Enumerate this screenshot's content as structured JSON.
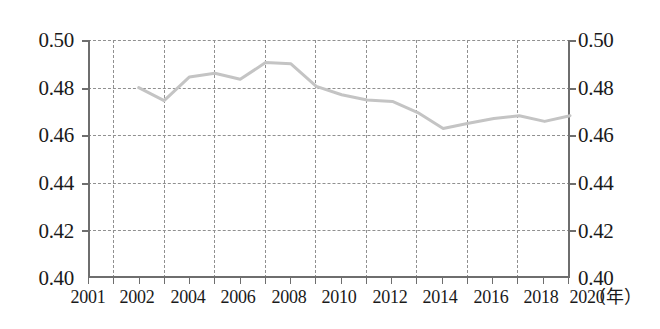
{
  "chart_data": {
    "type": "line",
    "title": "",
    "xlabel": "年",
    "ylabel": "",
    "xlim": [
      2001,
      2020
    ],
    "ylim": [
      0.4,
      0.5
    ],
    "grid": true,
    "legend": null,
    "x_tick_labels": [
      "2001",
      "2002",
      "2004",
      "2006",
      "2008",
      "2010",
      "2012",
      "2014",
      "2016",
      "2018",
      "2020"
    ],
    "x_tick_values": [
      2001,
      2002,
      2004,
      2006,
      2008,
      2010,
      2012,
      2014,
      2016,
      2018,
      2020
    ],
    "y_tick_labels_left": [
      "0.50",
      "0.48",
      "0.46",
      "0.44",
      "0.42",
      "0.40"
    ],
    "y_tick_labels_right": [
      "0.50",
      "0.48",
      "0.46",
      "0.44",
      "0.42",
      "0.40"
    ],
    "y_tick_values": [
      0.5,
      0.48,
      0.46,
      0.44,
      0.42,
      0.4
    ],
    "series": [
      {
        "name": "series-1",
        "color": "#c4c4c4",
        "x": [
          2003,
          2004,
          2005,
          2006,
          2007,
          2008,
          2009,
          2010,
          2011,
          2012,
          2013,
          2014,
          2015,
          2016,
          2017,
          2018,
          2019,
          2020
        ],
        "values": [
          0.48,
          0.4745,
          0.4845,
          0.486,
          0.4835,
          0.4905,
          0.49,
          0.4805,
          0.477,
          0.4748,
          0.4742,
          0.4695,
          0.4628,
          0.465,
          0.467,
          0.4682,
          0.4658,
          0.4682
        ]
      }
    ]
  },
  "axis": {
    "unit_label": "（年）"
  }
}
